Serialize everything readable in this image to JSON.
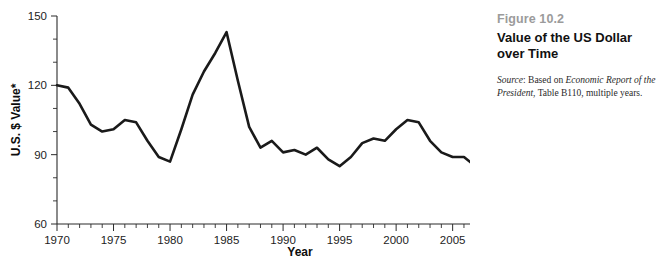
{
  "caption": {
    "figure_number": "Figure 10.2",
    "title": "Value of the US Dollar over Time",
    "source_label": "Source",
    "source_prefix": ": Based on ",
    "source_italic": "Economic Report of the President",
    "source_suffix": ", Table B110, multiple years."
  },
  "colors": {
    "line": "#1a1a1a",
    "axis": "#2b2b2b",
    "figure_number": "#9b9b9b",
    "title": "#111111",
    "background": "#ffffff"
  },
  "chart_data": {
    "type": "line",
    "title": "Value of the US Dollar over Time",
    "xlabel": "Year",
    "ylabel": "U.S. $ Value*",
    "xlim": [
      1970,
      2016
    ],
    "ylim": [
      60,
      150
    ],
    "y_ticks": [
      60,
      90,
      120,
      150
    ],
    "y_tick_labels": [
      "60",
      "90",
      "120",
      "150"
    ],
    "y_minor_tick_step": 10,
    "x_ticks": [
      1970,
      1975,
      1980,
      1985,
      1990,
      1995,
      2000,
      2005,
      2010,
      2015
    ],
    "x_tick_labels": [
      "1970",
      "1975",
      "1980",
      "1985",
      "1990",
      "1995",
      "2000",
      "2005",
      "2010",
      "2015"
    ],
    "x_minor_tick_step": 1,
    "grid": false,
    "legend": false,
    "series": [
      {
        "name": "U.S. Dollar Value",
        "x": [
          1970,
          1971,
          1972,
          1973,
          1974,
          1975,
          1976,
          1977,
          1978,
          1979,
          1980,
          1981,
          1982,
          1983,
          1984,
          1985,
          1986,
          1987,
          1988,
          1989,
          1990,
          1991,
          1992,
          1993,
          1994,
          1995,
          1996,
          1997,
          1998,
          1999,
          2000,
          2001,
          2002,
          2003,
          2004,
          2005,
          2006,
          2007,
          2008,
          2009,
          2010,
          2011,
          2012,
          2013,
          2014,
          2015,
          2016
        ],
        "values": [
          120,
          119,
          112,
          103,
          100,
          101,
          105,
          104,
          96,
          89,
          87,
          101,
          116,
          126,
          134,
          143,
          122,
          102,
          93,
          96,
          91,
          92,
          90,
          93,
          88,
          85,
          89,
          95,
          97,
          96,
          101,
          105,
          104,
          96,
          91,
          89,
          89,
          85,
          80,
          81,
          79,
          72,
          74,
          74,
          75,
          82,
          91
        ],
        "color": "#1a1a1a"
      }
    ]
  }
}
